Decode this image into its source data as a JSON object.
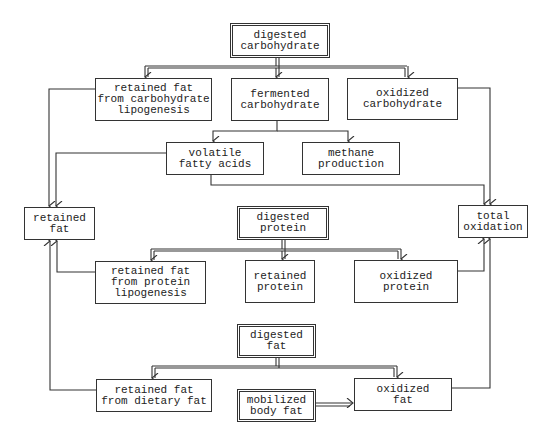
{
  "diagram": {
    "type": "flowchart",
    "title": "",
    "nodes": [
      {
        "id": "digested_carbohydrate",
        "label": "digested\ncarbohydrate",
        "style": "double"
      },
      {
        "id": "retained_fat_carb_lipo",
        "label": "retained fat\nfrom carbohydrate\nlipogenesis",
        "style": "single"
      },
      {
        "id": "fermented_carbohydrate",
        "label": "fermented\ncarbohydrate",
        "style": "single"
      },
      {
        "id": "oxidized_carbohydrate",
        "label": "oxidized\ncarbohydrate",
        "style": "single"
      },
      {
        "id": "volatile_fatty_acids",
        "label": "volatile\nfatty acids",
        "style": "single"
      },
      {
        "id": "methane_production",
        "label": "methane\nproduction",
        "style": "single"
      },
      {
        "id": "retained_fat",
        "label": "retained\nfat",
        "style": "single"
      },
      {
        "id": "total_oxidation",
        "label": "total\noxidation",
        "style": "single"
      },
      {
        "id": "digested_protein",
        "label": "digested\nprotein",
        "style": "double"
      },
      {
        "id": "retained_fat_protein_lipo",
        "label": "retained fat\nfrom protein\nlipogenesis",
        "style": "single"
      },
      {
        "id": "retained_protein",
        "label": "retained\nprotein",
        "style": "single"
      },
      {
        "id": "oxidized_protein",
        "label": "oxidized\nprotein",
        "style": "single"
      },
      {
        "id": "digested_fat",
        "label": "digested\nfat",
        "style": "double"
      },
      {
        "id": "retained_fat_dietary",
        "label": "retained fat\nfrom dietary fat",
        "style": "single"
      },
      {
        "id": "mobilized_body_fat",
        "label": "mobilized\nbody fat",
        "style": "double"
      },
      {
        "id": "oxidized_fat",
        "label": "oxidized\nfat",
        "style": "single"
      }
    ],
    "edges": [
      {
        "from": "digested_carbohydrate",
        "to": "retained_fat_carb_lipo",
        "style": "double"
      },
      {
        "from": "digested_carbohydrate",
        "to": "fermented_carbohydrate",
        "style": "double"
      },
      {
        "from": "digested_carbohydrate",
        "to": "oxidized_carbohydrate",
        "style": "double"
      },
      {
        "from": "fermented_carbohydrate",
        "to": "volatile_fatty_acids",
        "style": "single"
      },
      {
        "from": "fermented_carbohydrate",
        "to": "methane_production",
        "style": "single"
      },
      {
        "from": "retained_fat_carb_lipo",
        "to": "retained_fat",
        "style": "single"
      },
      {
        "from": "volatile_fatty_acids",
        "to": "retained_fat",
        "style": "single"
      },
      {
        "from": "volatile_fatty_acids",
        "to": "total_oxidation",
        "style": "single"
      },
      {
        "from": "oxidized_carbohydrate",
        "to": "total_oxidation",
        "style": "single"
      },
      {
        "from": "digested_protein",
        "to": "retained_fat_protein_lipo",
        "style": "double"
      },
      {
        "from": "digested_protein",
        "to": "retained_protein",
        "style": "double"
      },
      {
        "from": "digested_protein",
        "to": "oxidized_protein",
        "style": "double"
      },
      {
        "from": "retained_fat_protein_lipo",
        "to": "retained_fat",
        "style": "single"
      },
      {
        "from": "oxidized_protein",
        "to": "total_oxidation",
        "style": "single"
      },
      {
        "from": "digested_fat",
        "to": "retained_fat_dietary",
        "style": "double"
      },
      {
        "from": "digested_fat",
        "to": "oxidized_fat",
        "style": "double"
      },
      {
        "from": "mobilized_body_fat",
        "to": "oxidized_fat",
        "style": "double"
      },
      {
        "from": "retained_fat_dietary",
        "to": "retained_fat",
        "style": "single"
      },
      {
        "from": "oxidized_fat",
        "to": "total_oxidation",
        "style": "single"
      }
    ]
  },
  "labels": {
    "digested_carbohydrate": "digested\ncarbohydrate",
    "retained_fat_carb_lipo": "retained fat\nfrom carbohydrate\nlipogenesis",
    "fermented_carbohydrate": "fermented\ncarbohydrate",
    "oxidized_carbohydrate": "oxidized\ncarbohydrate",
    "volatile_fatty_acids": "volatile\nfatty acids",
    "methane_production": "methane\nproduction",
    "retained_fat": "retained\nfat",
    "total_oxidation": "total\noxidation",
    "digested_protein": "digested\nprotein",
    "retained_fat_protein_lipo": "retained fat\nfrom protein\nlipogenesis",
    "retained_protein": "retained\nprotein",
    "oxidized_protein": "oxidized\nprotein",
    "digested_fat": "digested\nfat",
    "retained_fat_dietary": "retained fat\nfrom dietary fat",
    "mobilized_body_fat": "mobilized\nbody fat",
    "oxidized_fat": "oxidized\nfat"
  },
  "colors": {
    "line": "#333333",
    "background": "#ffffff"
  }
}
